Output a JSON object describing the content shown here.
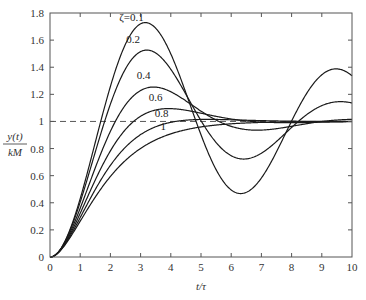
{
  "chart_data": {
    "type": "line",
    "title": "",
    "xlabel": "t/τ",
    "ylabel_num": "y(t)",
    "ylabel_den": "kM",
    "xlim": [
      0,
      10
    ],
    "ylim": [
      0,
      1.8
    ],
    "xticks": [
      0,
      1,
      2,
      3,
      4,
      5,
      6,
      7,
      8,
      9,
      10
    ],
    "yticks": [
      0,
      0.2,
      0.4,
      0.6,
      0.8,
      1,
      1.2,
      1.4,
      1.6,
      1.8
    ],
    "ytick_labels": [
      "0",
      "0.2",
      "0.4",
      "0.6",
      "0.8",
      "1",
      "1.2",
      "1.4",
      "1.6",
      "1.8"
    ],
    "grid": false,
    "reference_line": {
      "y": 1,
      "style": "dashed"
    },
    "series": [
      {
        "name": "ζ=0.1",
        "label": "ζ=0.1",
        "zeta": 0.1,
        "label_pos": [
          2.7,
          1.74
        ],
        "peak": {
          "x": 3.16,
          "y": 1.73
        }
      },
      {
        "name": "0.2",
        "label": "0.2",
        "zeta": 0.2,
        "label_pos": [
          2.75,
          1.58
        ],
        "peak": {
          "x": 3.21,
          "y": 1.53
        }
      },
      {
        "name": "0.4",
        "label": "0.4",
        "zeta": 0.4,
        "label_pos": [
          3.1,
          1.31
        ],
        "peak": {
          "x": 3.43,
          "y": 1.25
        }
      },
      {
        "name": "0.6",
        "label": "0.6",
        "zeta": 0.6,
        "label_pos": [
          3.5,
          1.15
        ],
        "peak": {
          "x": 3.93,
          "y": 1.09
        }
      },
      {
        "name": "0.8",
        "label": "0.8",
        "zeta": 0.8,
        "label_pos": [
          3.7,
          1.03
        ],
        "peak": {
          "x": 5.24,
          "y": 1.02
        }
      },
      {
        "name": "1",
        "label": "1",
        "zeta": 1.0,
        "label_pos": [
          3.75,
          0.94
        ],
        "peak": null
      }
    ]
  }
}
